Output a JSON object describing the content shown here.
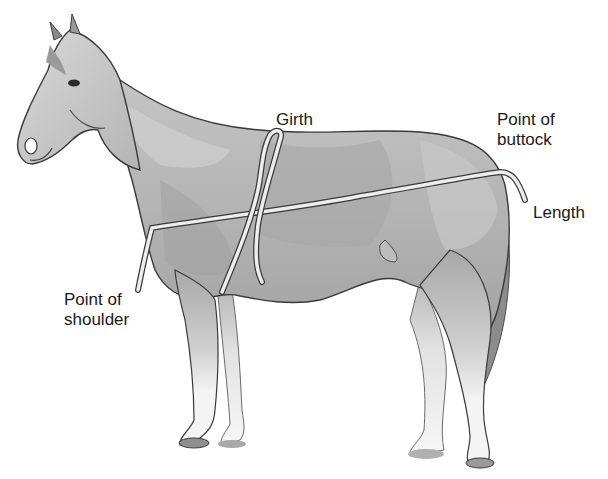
{
  "diagram": {
    "colors": {
      "background": "#ffffff",
      "body_mid": "#b5b5b5",
      "body_light": "#d6d6d6",
      "body_dark": "#8f8f8f",
      "legs_white": "#f2f2f2",
      "hoof": "#9a9a9a",
      "outline": "#3a3a3a",
      "tape": "#ededed",
      "text": "#1a1a1a"
    },
    "labels": {
      "girth": "Girth",
      "point_of_buttock": "Point of\nbuttock",
      "length": "Length",
      "point_of_shoulder": "Point of\nshoulder"
    },
    "measuring_tapes": [
      {
        "name": "girth-tape",
        "description": "Loop around barrel behind withers"
      },
      {
        "name": "length-tape",
        "description": "From point of shoulder to point of buttock"
      }
    ]
  }
}
